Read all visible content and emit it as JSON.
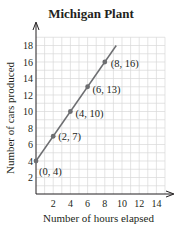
{
  "chart_data": {
    "type": "line",
    "title": "Michigan Plant",
    "xlabel": "Number of hours elapsed",
    "ylabel": "Number of  cars produced",
    "x_ticks": [
      2,
      4,
      6,
      8,
      10,
      12,
      14
    ],
    "y_ticks": [
      2,
      4,
      6,
      8,
      10,
      12,
      14,
      16,
      18
    ],
    "xlim": [
      0,
      15
    ],
    "ylim": [
      0,
      19
    ],
    "grid": true,
    "series": [
      {
        "name": "Michigan Plant",
        "x": [
          0,
          2,
          4,
          6,
          8
        ],
        "y": [
          4,
          7,
          10,
          13,
          16
        ],
        "line_extends_to": [
          9.33,
          18
        ]
      }
    ],
    "annotations": [
      "(0, 4)",
      "(2, 7)",
      "(4, 10)",
      "(6, 13)",
      "(8, 16)"
    ],
    "colors": {
      "line": "#6d6e71",
      "grid": "#d9d9d9",
      "axis": "#231f20"
    }
  }
}
